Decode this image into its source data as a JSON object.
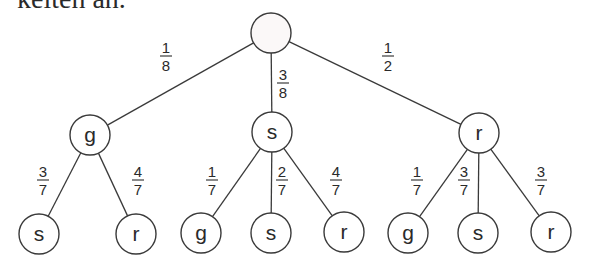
{
  "header": {
    "cutoff_text": "keiten an."
  },
  "tree": {
    "root": {
      "id": "root",
      "label": "",
      "cx": 271,
      "cy": 33
    },
    "level1": [
      {
        "id": "g",
        "label": "g",
        "cx": 90,
        "cy": 135,
        "prob": {
          "num": "1",
          "den": "8"
        },
        "lx": 166,
        "ly": 56
      },
      {
        "id": "s",
        "label": "s",
        "cx": 272,
        "cy": 132,
        "prob": {
          "num": "3",
          "den": "8"
        },
        "lx": 283,
        "ly": 83
      },
      {
        "id": "r",
        "label": "r",
        "cx": 479,
        "cy": 133,
        "prob": {
          "num": "1",
          "den": "2"
        },
        "lx": 388,
        "ly": 56
      }
    ],
    "level2": [
      {
        "parent": 0,
        "label": "s",
        "cx": 39,
        "cy": 234,
        "prob": {
          "num": "3",
          "den": "7"
        },
        "lx": 43,
        "ly": 180
      },
      {
        "parent": 0,
        "label": "r",
        "cx": 136,
        "cy": 234,
        "prob": {
          "num": "4",
          "den": "7"
        },
        "lx": 138,
        "ly": 180
      },
      {
        "parent": 1,
        "label": "g",
        "cx": 201,
        "cy": 233,
        "prob": {
          "num": "1",
          "den": "7"
        },
        "lx": 212,
        "ly": 180
      },
      {
        "parent": 1,
        "label": "s",
        "cx": 271,
        "cy": 233,
        "prob": {
          "num": "2",
          "den": "7"
        },
        "lx": 282,
        "ly": 180
      },
      {
        "parent": 1,
        "label": "r",
        "cx": 344,
        "cy": 232,
        "prob": {
          "num": "4",
          "den": "7"
        },
        "lx": 336,
        "ly": 180
      },
      {
        "parent": 2,
        "label": "g",
        "cx": 408,
        "cy": 233,
        "prob": {
          "num": "1",
          "den": "7"
        },
        "lx": 417,
        "ly": 180
      },
      {
        "parent": 2,
        "label": "s",
        "cx": 478,
        "cy": 233,
        "prob": {
          "num": "3",
          "den": "7"
        },
        "lx": 464,
        "ly": 180
      },
      {
        "parent": 2,
        "label": "r",
        "cx": 551,
        "cy": 232,
        "prob": {
          "num": "3",
          "den": "7"
        },
        "lx": 541,
        "ly": 180
      }
    ],
    "radius": 20
  }
}
